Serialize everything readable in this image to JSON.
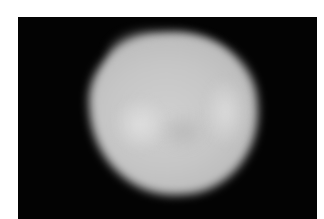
{
  "image": {
    "description": "Grayscale photograph of a bright, diffuse, irregular roughly round object on a black background",
    "background_color": "#030303",
    "margin_color": "#ffffff",
    "object_color": "#c8c8c8",
    "highlight_color": "#dcdcdc"
  },
  "caption": ""
}
